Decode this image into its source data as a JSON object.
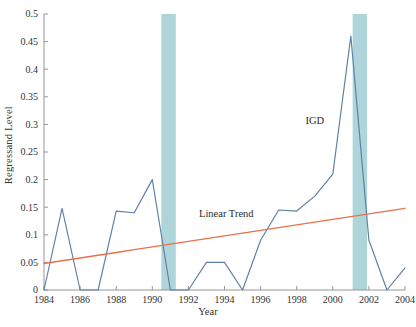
{
  "chart_data": {
    "type": "line",
    "title": "",
    "xlabel": "Year",
    "ylabel": "Regressand Level",
    "xlim": [
      1984,
      2004
    ],
    "ylim": [
      0,
      0.5
    ],
    "ytick_step": 0.05,
    "xtick_step": 2,
    "grid": false,
    "legend_position": "inline-annotations",
    "x": [
      1984,
      1985,
      1986,
      1987,
      1988,
      1989,
      1990,
      1991,
      1992,
      1993,
      1994,
      1995,
      1996,
      1997,
      1998,
      1999,
      2000,
      2001,
      2002,
      2003,
      2004
    ],
    "xticks": [
      "1984",
      "1986",
      "1988",
      "1990",
      "1992",
      "1994",
      "1996",
      "1998",
      "2000",
      "2002",
      "2004"
    ],
    "yticks": [
      "0",
      "0.05",
      "0.1",
      "0.15",
      "0.2",
      "0.25",
      "0.3",
      "0.35",
      "0.4",
      "0.45",
      "0.5"
    ],
    "series": [
      {
        "name": "IGD",
        "color": "#5b7fa6",
        "values": [
          0,
          0.148,
          0,
          0,
          0.143,
          0.14,
          0.2,
          0,
          0,
          0.05,
          0.05,
          0,
          0.09,
          0.145,
          0.143,
          0.17,
          0.21,
          0.46,
          0.09,
          0,
          0.04
        ]
      },
      {
        "name": "Linear Trend",
        "color": "#e8704a",
        "values": [
          0.048,
          0.053,
          0.058,
          0.063,
          0.068,
          0.073,
          0.078,
          0.083,
          0.088,
          0.093,
          0.098,
          0.103,
          0.108,
          0.113,
          0.118,
          0.123,
          0.128,
          0.133,
          0.138,
          0.143,
          0.148
        ]
      }
    ],
    "annotations": [
      {
        "text": "IGD",
        "x": 1999.0,
        "y": 0.3
      },
      {
        "text": "Linear Trend",
        "x": 1994.1,
        "y": 0.133
      }
    ],
    "shaded_bands": [
      {
        "x0": 1990.5,
        "x1": 1991.3,
        "color": "#aed5d9"
      },
      {
        "x0": 2001.1,
        "x1": 2001.9,
        "color": "#aed5d9"
      }
    ]
  }
}
